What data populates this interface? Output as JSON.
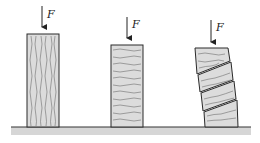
{
  "diagram": {
    "force_label": "F",
    "specimens": [
      {
        "id": "parallel-grain",
        "grain": "vertical",
        "state": "intact"
      },
      {
        "id": "perpendicular-grain",
        "grain": "horizontal",
        "state": "intact"
      },
      {
        "id": "sheared",
        "grain": "horizontal",
        "state": "sheared into segments"
      }
    ],
    "colors": {
      "block_fill": "#dcdcdc",
      "outline": "#2a2a2a",
      "grain": "#6e6e6e",
      "ground": "#d2d2d2"
    }
  }
}
